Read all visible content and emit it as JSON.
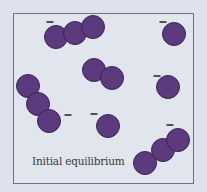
{
  "diagram": {
    "caption": "Initial equilibrium",
    "colors": {
      "background": "#dde2ec",
      "particle_fill": "#5b3a7e",
      "particle_stroke": "#3b2456",
      "frame_border": "#6f7278",
      "charge_mark": "#222222"
    },
    "particle_radius": 11.5,
    "groups": [
      {
        "id": "trimer-top-left",
        "charge": "-",
        "charge_pos": [
          50,
          22
        ],
        "particles": [
          [
            56,
            37
          ],
          [
            75,
            33
          ],
          [
            93,
            27
          ]
        ]
      },
      {
        "id": "monomer-top-right",
        "charge": "-",
        "charge_pos": [
          163,
          22
        ],
        "particles": [
          [
            174,
            34
          ]
        ]
      },
      {
        "id": "dimer-center",
        "charge": "",
        "charge_pos": null,
        "particles": [
          [
            94,
            70
          ],
          [
            112,
            78
          ]
        ]
      },
      {
        "id": "monomer-right",
        "charge": "-",
        "charge_pos": [
          157,
          76
        ],
        "particles": [
          [
            168,
            87
          ]
        ]
      },
      {
        "id": "trimer-left",
        "charge": "-",
        "charge_pos": [
          68,
          115
        ],
        "particles": [
          [
            28,
            86
          ],
          [
            38,
            104
          ],
          [
            49,
            121
          ]
        ]
      },
      {
        "id": "monomer-center-bottom",
        "charge": "-",
        "charge_pos": [
          94,
          114
        ],
        "particles": [
          [
            108,
            126
          ]
        ]
      },
      {
        "id": "trimer-bottom-right",
        "charge": "-",
        "charge_pos": [
          170,
          125
        ],
        "particles": [
          [
            145,
            163
          ],
          [
            163,
            150
          ],
          [
            178,
            140
          ]
        ]
      }
    ]
  }
}
